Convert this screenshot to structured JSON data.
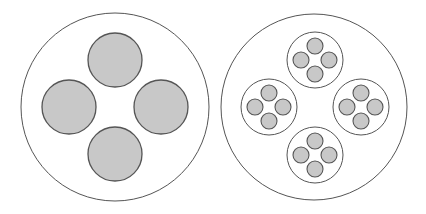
{
  "colors": {
    "background": "#ffffff",
    "outline": "#555555",
    "fill": "#c8c8c8",
    "container_fill": "#ffffff"
  },
  "diagram": {
    "left": {
      "description": "Large circle containing four gray filled circles",
      "outer": {
        "cx": 115,
        "cy": 107,
        "r": 94
      },
      "children": [
        {
          "cx": 115,
          "cy": 60,
          "r": 27
        },
        {
          "cx": 69,
          "cy": 107,
          "r": 27
        },
        {
          "cx": 161,
          "cy": 107,
          "r": 27
        },
        {
          "cx": 115,
          "cy": 154,
          "r": 27
        }
      ]
    },
    "right": {
      "description": "Large circle containing four sub-circles, each with four small gray circles",
      "outer": {
        "cx": 314,
        "cy": 107,
        "r": 93
      },
      "groups": [
        {
          "cx": 315,
          "cy": 60,
          "r": 28
        },
        {
          "cx": 269,
          "cy": 107,
          "r": 28
        },
        {
          "cx": 361,
          "cy": 107,
          "r": 28
        },
        {
          "cx": 315,
          "cy": 155,
          "r": 28
        }
      ],
      "mini": {
        "offset": 14,
        "r": 8
      }
    }
  }
}
